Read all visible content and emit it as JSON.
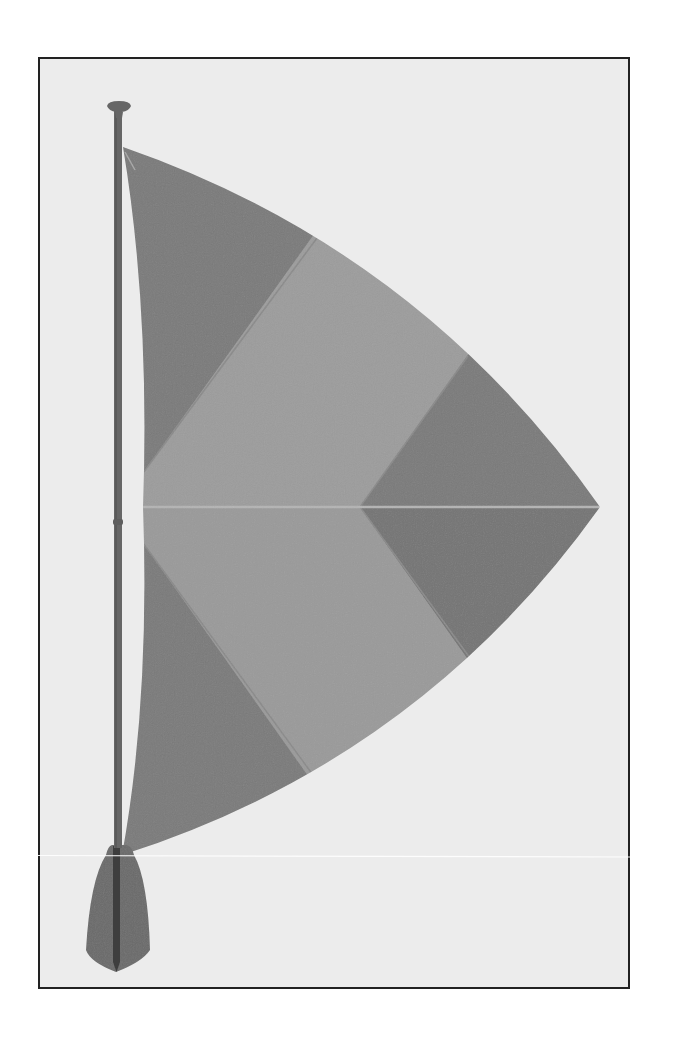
{
  "illustration": {
    "subject": "paddle-sail",
    "description": "Stand-up paddle with a triangular segmented sail attached to its shaft",
    "colors": {
      "page_background": "#ffffff",
      "frame_border": "#222222",
      "frame_background": "#ececec",
      "sail_dark_panel": "#7a7a7a",
      "sail_light_band": "#9c9c9c",
      "sail_seam": "#b4b4b4",
      "paddle": "#6a6a6a",
      "paddle_spine": "#3a3a3a",
      "highlight_line": "#ffffff"
    },
    "parts": [
      {
        "name": "paddle-handle"
      },
      {
        "name": "paddle-shaft"
      },
      {
        "name": "paddle-blade"
      },
      {
        "name": "sail-top-dark-panel"
      },
      {
        "name": "sail-middle-light-band"
      },
      {
        "name": "sail-tip-dark-diamond"
      },
      {
        "name": "sail-bottom-dark-panel"
      },
      {
        "name": "sail-center-seam"
      }
    ]
  }
}
